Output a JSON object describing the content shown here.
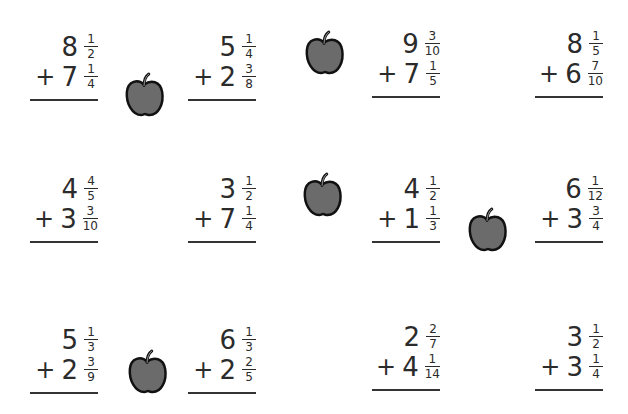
{
  "worksheet": {
    "title": "",
    "problems": [
      {
        "a_whole": "8",
        "a_num": "1",
        "a_den": "2",
        "op": "+",
        "b_whole": "7",
        "b_num": "1",
        "b_den": "4"
      },
      {
        "a_whole": "5",
        "a_num": "1",
        "a_den": "4",
        "op": "+",
        "b_whole": "2",
        "b_num": "3",
        "b_den": "8"
      },
      {
        "a_whole": "9",
        "a_num": "3",
        "a_den": "10",
        "op": "+",
        "b_whole": "7",
        "b_num": "1",
        "b_den": "5"
      },
      {
        "a_whole": "8",
        "a_num": "1",
        "a_den": "5",
        "op": "+",
        "b_whole": "6",
        "b_num": "7",
        "b_den": "10"
      },
      {
        "a_whole": "4",
        "a_num": "4",
        "a_den": "5",
        "op": "+",
        "b_whole": "3",
        "b_num": "3",
        "b_den": "10"
      },
      {
        "a_whole": "3",
        "a_num": "1",
        "a_den": "2",
        "op": "+",
        "b_whole": "7",
        "b_num": "1",
        "b_den": "4"
      },
      {
        "a_whole": "4",
        "a_num": "1",
        "a_den": "2",
        "op": "+",
        "b_whole": "1",
        "b_num": "1",
        "b_den": "3"
      },
      {
        "a_whole": "6",
        "a_num": "1",
        "a_den": "12",
        "op": "+",
        "b_whole": "3",
        "b_num": "3",
        "b_den": "4"
      },
      {
        "a_whole": "5",
        "a_num": "1",
        "a_den": "3",
        "op": "+",
        "b_whole": "2",
        "b_num": "3",
        "b_den": "9"
      },
      {
        "a_whole": "6",
        "a_num": "1",
        "a_den": "3",
        "op": "+",
        "b_whole": "2",
        "b_num": "2",
        "b_den": "5"
      },
      {
        "a_whole": "2",
        "a_num": "2",
        "a_den": "7",
        "op": "+",
        "b_whole": "4",
        "b_num": "1",
        "b_den": "14"
      },
      {
        "a_whole": "3",
        "a_num": "1",
        "a_den": "2",
        "op": "+",
        "b_whole": "3",
        "b_num": "1",
        "b_den": "4"
      }
    ],
    "decorations": {
      "icon": "apple-icon",
      "apple_fill": "#6b6b6b",
      "apple_outline": "#111111"
    }
  }
}
